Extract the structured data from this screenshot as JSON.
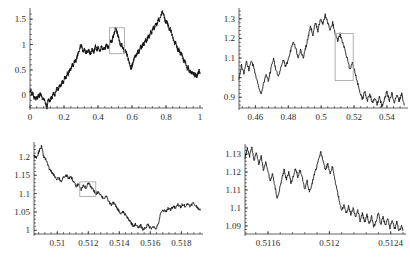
{
  "figure": {
    "title": "",
    "panel_count": 4,
    "series_color": "#121212",
    "zoom_box_color": "#a9a9a9",
    "axis_color": "#3a3a3a",
    "background_color": "#ffffff"
  },
  "chart_data": [
    {
      "id": "panel-top-left",
      "type": "line",
      "title": "",
      "xlabel": "",
      "ylabel": "",
      "grid": false,
      "legend": false,
      "xlim": [
        0,
        1
      ],
      "ylim": [
        -0.25,
        1.68
      ],
      "xticks": [
        0,
        0.2,
        0.4,
        0.6,
        0.8,
        1
      ],
      "xticklabels": [
        "0",
        "0.2",
        "0.4",
        "0.6",
        "0.8",
        "1"
      ],
      "yticks": [
        0,
        0.5,
        1,
        1.5
      ],
      "yticklabels": [
        "0",
        "0.5",
        "1",
        "1.5"
      ],
      "zoom_box": {
        "x0": 0.468,
        "x1": 0.556,
        "y0": 0.82,
        "y1": 1.33
      },
      "series": [
        {
          "name": "brownian-path",
          "x": [
            0,
            0.005,
            0.01,
            0.015,
            0.02,
            0.025,
            0.03,
            0.035,
            0.04,
            0.045,
            0.05,
            0.055,
            0.06,
            0.065,
            0.07,
            0.075,
            0.08,
            0.085,
            0.09,
            0.095,
            0.1,
            0.105,
            0.11,
            0.115,
            0.12,
            0.125,
            0.13,
            0.135,
            0.14,
            0.145,
            0.15,
            0.155,
            0.16,
            0.165,
            0.17,
            0.175,
            0.18,
            0.185,
            0.19,
            0.195,
            0.2,
            0.205,
            0.21,
            0.215,
            0.22,
            0.225,
            0.23,
            0.235,
            0.24,
            0.245,
            0.25,
            0.255,
            0.26,
            0.265,
            0.27,
            0.275,
            0.28,
            0.285,
            0.29,
            0.295,
            0.3,
            0.305,
            0.31,
            0.315,
            0.32,
            0.325,
            0.33,
            0.335,
            0.34,
            0.345,
            0.35,
            0.355,
            0.36,
            0.365,
            0.37,
            0.375,
            0.38,
            0.385,
            0.39,
            0.395,
            0.4,
            0.405,
            0.41,
            0.415,
            0.42,
            0.425,
            0.43,
            0.435,
            0.44,
            0.445,
            0.45,
            0.455,
            0.46,
            0.465,
            0.47,
            0.475,
            0.48,
            0.485,
            0.49,
            0.495,
            0.5,
            0.505,
            0.51,
            0.515,
            0.52,
            0.525,
            0.53,
            0.535,
            0.54,
            0.545,
            0.55,
            0.555,
            0.56,
            0.565,
            0.57,
            0.575,
            0.58,
            0.585,
            0.59,
            0.595,
            0.6,
            0.605,
            0.61,
            0.615,
            0.62,
            0.625,
            0.63,
            0.635,
            0.64,
            0.645,
            0.65,
            0.655,
            0.66,
            0.665,
            0.67,
            0.675,
            0.68,
            0.685,
            0.69,
            0.695,
            0.7,
            0.705,
            0.71,
            0.715,
            0.72,
            0.725,
            0.73,
            0.735,
            0.74,
            0.745,
            0.75,
            0.755,
            0.76,
            0.765,
            0.77,
            0.775,
            0.78,
            0.785,
            0.79,
            0.795,
            0.8,
            0.805,
            0.81,
            0.815,
            0.82,
            0.825,
            0.83,
            0.835,
            0.84,
            0.845,
            0.85,
            0.855,
            0.86,
            0.865,
            0.87,
            0.875,
            0.88,
            0.885,
            0.89,
            0.895,
            0.9,
            0.905,
            0.91,
            0.915,
            0.92,
            0.925,
            0.93,
            0.935,
            0.94,
            0.945,
            0.95,
            0.955,
            0.96,
            0.965,
            0.97,
            0.975,
            0.98,
            0.985,
            0.99,
            0.995,
            1
          ],
          "y": [
            0.05,
            0.1,
            0.02,
            0.06,
            -0.02,
            -0.06,
            -0.03,
            -0.08,
            -0.04,
            -0.05,
            0.01,
            -0.03,
            0.03,
            0.0,
            -0.04,
            -0.08,
            -0.05,
            -0.1,
            -0.14,
            -0.2,
            -0.24,
            -0.12,
            -0.08,
            -0.12,
            -0.09,
            -0.04,
            -0.06,
            0.02,
            0.05,
            0.0,
            0.04,
            0.12,
            0.16,
            0.11,
            0.15,
            0.2,
            0.17,
            0.22,
            0.27,
            0.24,
            0.3,
            0.36,
            0.33,
            0.39,
            0.44,
            0.41,
            0.47,
            0.52,
            0.5,
            0.56,
            0.62,
            0.59,
            0.65,
            0.7,
            0.67,
            0.73,
            0.79,
            0.84,
            0.9,
            0.96,
            1.0,
            0.95,
            0.89,
            0.86,
            0.91,
            0.87,
            0.83,
            0.88,
            0.84,
            0.9,
            0.86,
            0.81,
            0.85,
            0.92,
            0.88,
            0.84,
            0.9,
            0.97,
            0.93,
            0.89,
            0.94,
            0.9,
            0.86,
            0.91,
            0.96,
            0.92,
            0.88,
            0.93,
            0.89,
            0.95,
            1.0,
            0.96,
            0.92,
            0.97,
            1.03,
            1.08,
            1.04,
            1.1,
            1.16,
            1.22,
            1.28,
            1.33,
            1.26,
            1.2,
            1.14,
            1.08,
            1.02,
            0.97,
            1.0,
            0.95,
            0.9,
            0.86,
            0.9,
            0.85,
            0.8,
            0.74,
            0.68,
            0.62,
            0.57,
            0.52,
            0.58,
            0.64,
            0.7,
            0.75,
            0.8,
            0.76,
            0.82,
            0.88,
            0.84,
            0.9,
            0.96,
            0.92,
            0.97,
            1.02,
            0.98,
            1.04,
            1.1,
            1.06,
            1.12,
            1.18,
            1.14,
            1.2,
            1.26,
            1.22,
            1.28,
            1.34,
            1.3,
            1.36,
            1.42,
            1.38,
            1.44,
            1.5,
            1.46,
            1.52,
            1.58,
            1.62,
            1.66,
            1.6,
            1.54,
            1.48,
            1.42,
            1.46,
            1.4,
            1.34,
            1.28,
            1.32,
            1.26,
            1.2,
            1.14,
            1.08,
            1.02,
            1.06,
            1.0,
            0.94,
            0.88,
            0.92,
            0.86,
            0.8,
            0.84,
            0.78,
            0.72,
            0.66,
            0.7,
            0.64,
            0.58,
            0.52,
            0.56,
            0.5,
            0.44,
            0.48,
            0.42,
            0.46,
            0.4,
            0.44,
            0.38,
            0.42,
            0.36,
            0.4,
            0.45,
            0.5,
            0.44,
            0.38,
            0.34
          ]
        }
      ]
    },
    {
      "id": "panel-top-right",
      "type": "line",
      "title": "",
      "xlabel": "",
      "ylabel": "",
      "grid": false,
      "legend": false,
      "xlim": [
        0.45,
        0.551
      ],
      "ylim": [
        0.845,
        1.345
      ],
      "xticks": [
        0.46,
        0.48,
        0.5,
        0.52,
        0.54
      ],
      "xticklabels": [
        "0.46",
        "0.48",
        "0.5",
        "0.52",
        "0.54"
      ],
      "yticks": [
        0.9,
        1.0,
        1.1,
        1.2,
        1.3
      ],
      "yticklabels": [
        "0.9",
        "1",
        "1.1",
        "1.2",
        "1.3"
      ],
      "zoom_box": {
        "x0": 0.5085,
        "x1": 0.5195,
        "y0": 0.985,
        "y1": 1.225
      },
      "series": [
        {
          "name": "brownian-path",
          "x": [
            0.45,
            0.4515,
            0.453,
            0.4545,
            0.456,
            0.4575,
            0.459,
            0.4605,
            0.462,
            0.4635,
            0.465,
            0.4665,
            0.468,
            0.4695,
            0.471,
            0.4725,
            0.474,
            0.4755,
            0.477,
            0.4785,
            0.48,
            0.4815,
            0.483,
            0.4845,
            0.486,
            0.4875,
            0.489,
            0.4905,
            0.492,
            0.4935,
            0.495,
            0.4965,
            0.498,
            0.4995,
            0.501,
            0.5025,
            0.504,
            0.5055,
            0.507,
            0.5085,
            0.51,
            0.5115,
            0.513,
            0.5145,
            0.516,
            0.5175,
            0.519,
            0.5205,
            0.522,
            0.5235,
            0.525,
            0.5265,
            0.528,
            0.5295,
            0.531,
            0.5325,
            0.534,
            0.5355,
            0.537,
            0.5385,
            0.54,
            0.5415,
            0.543,
            0.5445,
            0.546,
            0.5475,
            0.549,
            0.5505
          ],
          "y": [
            1.0,
            1.06,
            1.02,
            1.08,
            1.04,
            1.09,
            1.05,
            1.0,
            0.95,
            0.92,
            0.97,
            1.02,
            0.98,
            1.05,
            1.1,
            1.04,
            1.0,
            1.05,
            1.09,
            1.05,
            1.1,
            1.14,
            1.19,
            1.15,
            1.1,
            1.14,
            1.1,
            1.15,
            1.2,
            1.26,
            1.22,
            1.28,
            1.24,
            1.3,
            1.27,
            1.32,
            1.28,
            1.24,
            1.28,
            1.23,
            1.19,
            1.22,
            1.18,
            1.14,
            1.09,
            1.04,
            1.08,
            1.03,
            0.98,
            0.93,
            0.89,
            0.93,
            0.88,
            0.92,
            0.87,
            0.9,
            0.86,
            0.9,
            0.85,
            0.89,
            0.93,
            0.88,
            0.92,
            0.87,
            0.91,
            0.88,
            0.92,
            0.86
          ]
        }
      ]
    },
    {
      "id": "panel-bottom-left",
      "type": "line",
      "title": "",
      "xlabel": "",
      "ylabel": "",
      "grid": false,
      "legend": false,
      "xlim": [
        0.5085,
        0.5192
      ],
      "ylim": [
        0.99,
        1.235
      ],
      "xticks": [
        0.51,
        0.512,
        0.514,
        0.516,
        0.518
      ],
      "xticklabels": [
        "0.51",
        "0.512",
        "0.514",
        "0.516",
        "0.518"
      ],
      "yticks": [
        1.0,
        1.05,
        1.1,
        1.15,
        1.2
      ],
      "yticklabels": [
        "1",
        "1.05",
        "1.1",
        "1.15",
        "1.2"
      ],
      "zoom_box": {
        "x0": 0.51145,
        "x1": 0.51248,
        "y0": 1.092,
        "y1": 1.132
      },
      "series": [
        {
          "name": "brownian-path",
          "x": [
            0.5085,
            0.50866,
            0.50882,
            0.50898,
            0.50914,
            0.5093,
            0.50946,
            0.50962,
            0.50978,
            0.50994,
            0.5101,
            0.51026,
            0.51042,
            0.51058,
            0.51074,
            0.5109,
            0.51106,
            0.51122,
            0.51138,
            0.51154,
            0.5117,
            0.51186,
            0.51202,
            0.51218,
            0.51234,
            0.5125,
            0.51266,
            0.51282,
            0.51298,
            0.51314,
            0.5133,
            0.51346,
            0.51362,
            0.51378,
            0.51394,
            0.5141,
            0.51426,
            0.51442,
            0.51458,
            0.51474,
            0.5149,
            0.51506,
            0.51522,
            0.51538,
            0.51554,
            0.5157,
            0.51586,
            0.51602,
            0.51618,
            0.51634,
            0.5165,
            0.51666,
            0.51682,
            0.51698,
            0.51714,
            0.5173,
            0.51746,
            0.51762,
            0.51778,
            0.51794,
            0.5181,
            0.51826,
            0.51842,
            0.51858,
            0.51874,
            0.5189,
            0.51906,
            0.51922
          ],
          "y": [
            1.205,
            1.195,
            1.215,
            1.228,
            1.2,
            1.19,
            1.17,
            1.16,
            1.15,
            1.14,
            1.143,
            1.133,
            1.145,
            1.15,
            1.14,
            1.145,
            1.13,
            1.12,
            1.125,
            1.112,
            1.122,
            1.116,
            1.128,
            1.118,
            1.108,
            1.1,
            1.105,
            1.095,
            1.087,
            1.092,
            1.08,
            1.07,
            1.075,
            1.065,
            1.055,
            1.045,
            1.05,
            1.04,
            1.032,
            1.022,
            1.012,
            1.017,
            1.006,
            1.013,
            1.002,
            1.008,
            1.015,
            1.005,
            1.012,
            1.003,
            1.015,
            1.045,
            1.055,
            1.05,
            1.06,
            1.057,
            1.065,
            1.06,
            1.07,
            1.063,
            1.072,
            1.065,
            1.073,
            1.066,
            1.074,
            1.068,
            1.062,
            1.055
          ]
        }
      ]
    },
    {
      "id": "panel-bottom-right",
      "type": "line",
      "title": "",
      "xlabel": "",
      "ylabel": "",
      "grid": false,
      "legend": false,
      "xlim": [
        0.51145,
        0.51248
      ],
      "ylim": [
        1.0855,
        1.1345
      ],
      "xticks": [
        0.5116,
        0.512,
        0.5124
      ],
      "xticklabels": [
        "0.5116",
        "0.512",
        "0.5124"
      ],
      "yticks": [
        1.09,
        1.1,
        1.11,
        1.12,
        1.13
      ],
      "yticklabels": [
        "1.09",
        "1.1",
        "1.11",
        "1.12",
        "1.13"
      ],
      "zoom_box": null,
      "series": [
        {
          "name": "brownian-path",
          "x": [
            0.51145,
            0.511465,
            0.51148,
            0.511495,
            0.51151,
            0.511525,
            0.51154,
            0.511555,
            0.51157,
            0.511585,
            0.5116,
            0.511615,
            0.51163,
            0.511645,
            0.51166,
            0.511675,
            0.51169,
            0.511705,
            0.51172,
            0.511735,
            0.51175,
            0.511765,
            0.51178,
            0.511795,
            0.51181,
            0.511825,
            0.51184,
            0.511855,
            0.51187,
            0.511885,
            0.5119,
            0.511915,
            0.51193,
            0.511945,
            0.51196,
            0.511975,
            0.51199,
            0.512005,
            0.51202,
            0.512035,
            0.51205,
            0.512065,
            0.51208,
            0.512095,
            0.51211,
            0.512125,
            0.51214,
            0.512155,
            0.51217,
            0.512185,
            0.5122,
            0.512215,
            0.51223,
            0.512245,
            0.51226,
            0.512275,
            0.51229,
            0.512305,
            0.51232,
            0.512335,
            0.51235,
            0.512365,
            0.51238,
            0.512395,
            0.51241,
            0.512425,
            0.51244,
            0.512455,
            0.51247,
            0.51248
          ],
          "y": [
            1.128,
            1.133,
            1.129,
            1.134,
            1.126,
            1.131,
            1.124,
            1.129,
            1.121,
            1.126,
            1.12,
            1.115,
            1.119,
            1.112,
            1.105,
            1.11,
            1.116,
            1.121,
            1.116,
            1.12,
            1.114,
            1.118,
            1.122,
            1.117,
            1.121,
            1.116,
            1.11,
            1.115,
            1.109,
            1.113,
            1.118,
            1.122,
            1.127,
            1.131,
            1.126,
            1.121,
            1.125,
            1.119,
            1.123,
            1.116,
            1.11,
            1.104,
            1.098,
            1.102,
            1.097,
            1.101,
            1.096,
            1.1,
            1.095,
            1.099,
            1.093,
            1.097,
            1.092,
            1.096,
            1.091,
            1.095,
            1.089,
            1.093,
            1.097,
            1.091,
            1.095,
            1.09,
            1.094,
            1.089,
            1.093,
            1.088,
            1.092,
            1.087,
            1.0895,
            1.0875
          ]
        }
      ]
    }
  ]
}
